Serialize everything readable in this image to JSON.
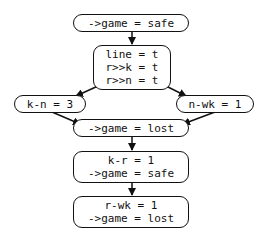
{
  "diagram": {
    "type": "flow",
    "nodes": {
      "n1": {
        "lines": [
          "->game = safe"
        ]
      },
      "n2": {
        "lines": [
          "line = t",
          "r>>k = t",
          "r>>n = t"
        ]
      },
      "n3": {
        "lines": [
          "k-n = 3"
        ]
      },
      "n4": {
        "lines": [
          "n-wk = 1"
        ]
      },
      "n5": {
        "lines": [
          "->game = lost"
        ]
      },
      "n6": {
        "lines": [
          "k-r = 1",
          "->game = safe"
        ]
      },
      "n7": {
        "lines": [
          "r-wk = 1",
          "->game = lost"
        ]
      }
    },
    "edges": [
      {
        "from": "n1",
        "to": "n2"
      },
      {
        "from": "n2",
        "to": "n3"
      },
      {
        "from": "n2",
        "to": "n4"
      },
      {
        "from": "n3",
        "to": "n5"
      },
      {
        "from": "n4",
        "to": "n5"
      },
      {
        "from": "n5",
        "to": "n6"
      },
      {
        "from": "n6",
        "to": "n7"
      }
    ],
    "colors": {
      "stroke": "#111111",
      "fill": "#ffffff",
      "text": "#111111"
    }
  }
}
